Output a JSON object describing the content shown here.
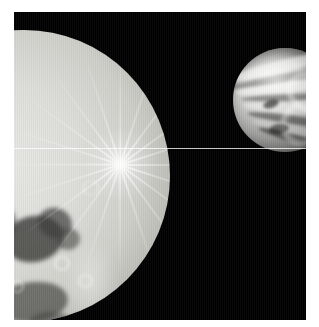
{
  "image": {
    "title": "Two planetary bodies against black space",
    "border_color": "#ffffff",
    "sky_color": "#000000",
    "alt_text": "A large bright cratered icy moon fills the lower left of the frame, with a smaller banded body at upper right against black space."
  },
  "objects": {
    "primary": {
      "name": "large-foreground-moon",
      "description": "Large bright icy cratered moon, right limb visible, partially cropped at left and bottom",
      "surface_color": "#cfcfca",
      "features": [
        "bright ray crater with radiating ray system",
        "dark regio terrain patches",
        "numerous impact craters",
        "bright crater rims"
      ]
    },
    "secondary": {
      "name": "small-background-body",
      "description": "Smaller body at upper right with swirling banded cloud-like streaks, cropped by the right frame edge",
      "surface_color": "#9e9e9c",
      "features": [
        "linear swirling bands",
        "dark shaded limb at lower right"
      ]
    }
  },
  "artifacts": {
    "scanline": {
      "name": "horizontal-scan-line",
      "color": "#ffffff",
      "position_y": 148
    },
    "raster": {
      "name": "vertical-raster-striping"
    }
  }
}
